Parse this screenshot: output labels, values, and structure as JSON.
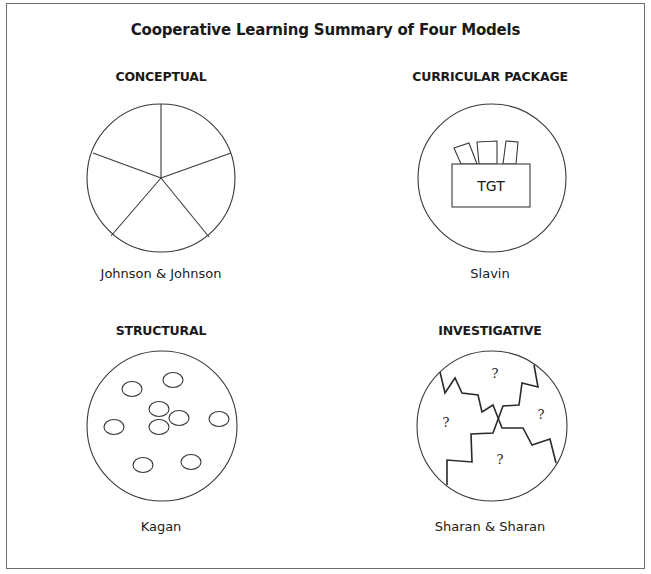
{
  "title": "Cooperative Learning Summary of Four Models",
  "models": [
    {
      "heading": "CONCEPTUAL",
      "author": "Johnson & Johnson",
      "icon": "circle-divided-five-segments"
    },
    {
      "heading": "CURRICULAR PACKAGE",
      "author": "Slavin",
      "icon": "box-with-cards",
      "box_label": "TGT"
    },
    {
      "heading": "STRUCTURAL",
      "author": "Kagan",
      "icon": "circle-with-small-ovals"
    },
    {
      "heading": "INVESTIGATIVE",
      "author": "Sharan & Sharan",
      "icon": "circle-with-zigzag-regions",
      "region_marks": [
        "?",
        "?",
        "?",
        "?"
      ]
    }
  ],
  "colors": {
    "line": "#3a3a3a",
    "frame": "#6e6e6e",
    "text": "#1a1a1a"
  }
}
